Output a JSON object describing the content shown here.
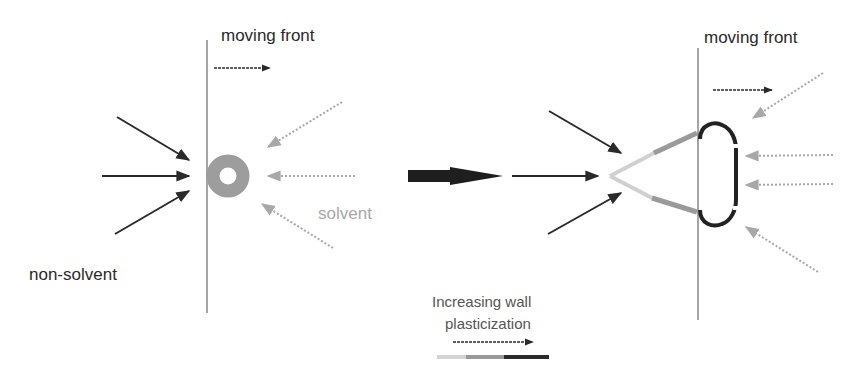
{
  "panels": {
    "left": {
      "front_label": "moving front",
      "solvent_label": "solvent",
      "nonsolvent_label": "non-solvent",
      "nucleus_shape": "ring"
    },
    "right": {
      "front_label": "moving front",
      "structure_shape": "macrovoid-finger"
    }
  },
  "transition_arrow": "large-right-arrow",
  "legend": {
    "line1": "Increasing wall",
    "line2": "plasticization",
    "gradient_colors": [
      "#d4d4d4",
      "#9a9a9a",
      "#2a2a2a"
    ]
  },
  "colors": {
    "nonsolvent_arrow": "#2a2a2a",
    "solvent_arrow": "#a8a8a8",
    "front_line": "#6a6a6a",
    "ring_fill": "#9d9d9d",
    "wall_light": "#d0d0d0",
    "wall_mid": "#9a9a9a",
    "wall_dark": "#222222"
  }
}
